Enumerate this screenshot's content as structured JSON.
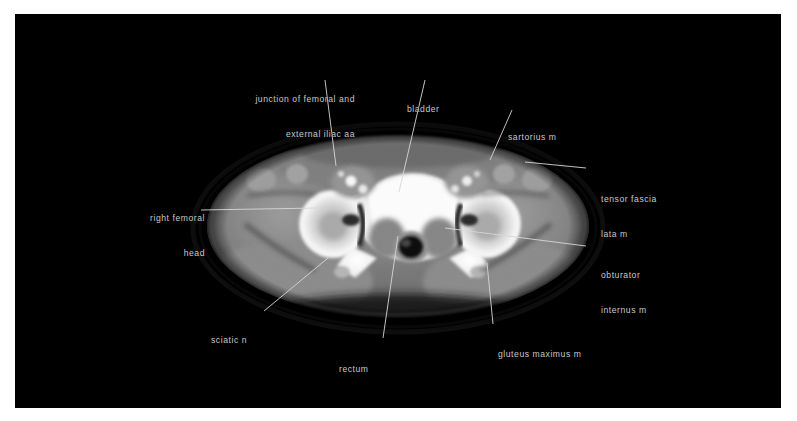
{
  "figure": {
    "kind": "axial-ct-pelvis",
    "modality": "CT",
    "plane": "axial",
    "region": "pelvis",
    "background_color": "#000000",
    "page_color": "#ffffff",
    "label_color": "#c9c9c9",
    "leader_color": "#d7d7d7"
  },
  "labels": {
    "femoral_junction": {
      "line1": "junction of femoral and",
      "line2": "external iliac aa"
    },
    "bladder": {
      "line1": "bladder"
    },
    "sartorius": {
      "line1": "sartorius m"
    },
    "tensor_fascia_lata": {
      "line1": "tensor fascia",
      "line2": "lata m"
    },
    "right_femoral_head": {
      "line1": "right femoral",
      "line2": "head"
    },
    "obturator_internus": {
      "line1": "obturator",
      "line2": "internus m"
    },
    "gluteus_maximus": {
      "line1": "gluteus maximus m"
    },
    "sciatic_nerve": {
      "line1": "sciatic n"
    },
    "rectum": {
      "line1": "rectum"
    }
  }
}
